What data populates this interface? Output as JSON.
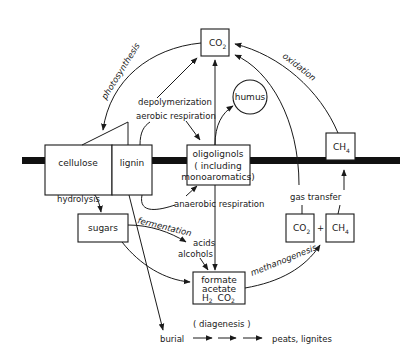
{
  "diagram": {
    "type": "carbon-cycle-flow-diagram",
    "nodes": {
      "co2_top": {
        "label": "CO2",
        "base": "CO",
        "sub": "2"
      },
      "humus": {
        "label": "humus"
      },
      "cellulose": {
        "label": "cellulose"
      },
      "lignin": {
        "label": "lignin"
      },
      "oligolignols": {
        "line1": "oligolignols",
        "line2": "( including",
        "line3": "monoaromatics)"
      },
      "ch4_top": {
        "label": "CH4",
        "base": "CH",
        "sub": "4"
      },
      "sugars": {
        "label": "sugars"
      },
      "acids_alcohols": {
        "line1": "acids",
        "line2": "alcohols"
      },
      "formate": {
        "line1": "formate",
        "line2": "acetate",
        "line3_a": "H",
        "line3_a_sub": "2",
        "line3_b": "CO",
        "line3_b_sub": "2"
      },
      "co2_bottom": {
        "label": "CO2",
        "base": "CO",
        "sub": "2"
      },
      "plus": {
        "label": "+"
      },
      "ch4_bottom": {
        "label": "CH4",
        "base": "CH",
        "sub": "4"
      },
      "burial": {
        "label": "burial"
      },
      "peats": {
        "label": "peats, lignites"
      }
    },
    "process_labels": {
      "photosynthesis": "photosynthesis",
      "depolymerization": "depolymerization",
      "aerobic_respiration": "aerobic  respiration",
      "oxidation": "oxidation",
      "hydrolysis": "hydrolysis",
      "anaerobic_respiration": "anaerobic  respiration",
      "fermentation": "fermentation",
      "gas_transfer": "gas  transfer",
      "methanogenesis": "methanogenesis",
      "diagenesis": "( diagenesis )"
    },
    "colors": {
      "ink": "#1a1a1a",
      "background": "#ffffff",
      "bar": "#111111"
    }
  }
}
